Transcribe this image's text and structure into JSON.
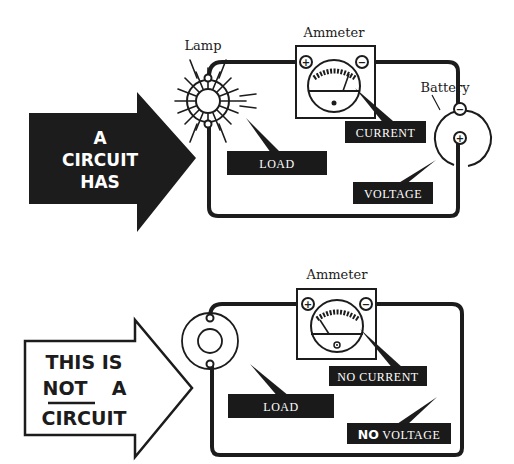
{
  "colors": {
    "ink": "#1c1c1c",
    "paper": "#ffffff",
    "label_bg": "#1a1a1a",
    "label_fg": "#ffffff"
  },
  "top_panel": {
    "arrow": {
      "style": "filled",
      "lines": [
        "A",
        "CIRCUIT",
        "HAS"
      ]
    },
    "component_labels": {
      "lamp": "Lamp",
      "ammeter": "Ammeter",
      "battery": "Battery"
    },
    "callouts": {
      "current": "CURRENT",
      "load": "LOAD",
      "voltage": "VOLTAGE"
    },
    "terminals": {
      "ammeter_plus": "+",
      "ammeter_minus": "−",
      "battery_minus": "−",
      "battery_plus": "+"
    },
    "lamp_state": "lit"
  },
  "bottom_panel": {
    "arrow": {
      "style": "outline",
      "lines": [
        "THIS IS",
        "NOT",
        "A",
        "CIRCUIT"
      ],
      "underlined_word": "NOT"
    },
    "component_labels": {
      "ammeter": "Ammeter"
    },
    "callouts": {
      "no_current": "NO CURRENT",
      "load": "LOAD",
      "no_voltage_bold": "NO",
      "no_voltage_rest": " VOLTAGE"
    },
    "terminals": {
      "ammeter_plus": "+",
      "ammeter_minus": "−"
    },
    "lamp_state": "unlit"
  }
}
